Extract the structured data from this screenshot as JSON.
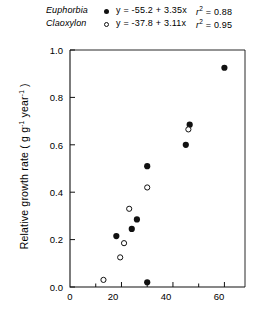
{
  "legend": {
    "entries": [
      {
        "species": "Euphorbia",
        "marker": "filled-circle",
        "equation": "y = -55.2  + 3.35x",
        "r2_label": "r",
        "r2_exp": "2",
        "r2_value": "= 0.88"
      },
      {
        "species": "Claoxylon",
        "marker": "open-circle",
        "equation": "y = -37.8  + 3.11x",
        "r2_label": "r",
        "r2_exp": "2",
        "r2_value": "= 0.95"
      }
    ]
  },
  "axes": {
    "ylabel_pre": "Relative growth rate ( g g",
    "ylabel_sup1": "-1",
    "ylabel_mid": " year",
    "ylabel_sup2": "-1",
    "ylabel_post": " )",
    "yticks": [
      "0.0",
      "0.2",
      "0.4",
      "0.6",
      "0.8",
      "1.0"
    ],
    "xticks": [
      "0",
      "20",
      "40",
      "60"
    ]
  },
  "colors": {
    "axis": "#111111",
    "marker": "#111111",
    "background": "#ffffff"
  },
  "chart_data": {
    "type": "scatter",
    "title": "",
    "xlabel": "",
    "ylabel": "Relative growth rate (g g-1 year-1)",
    "xlim": [
      0,
      68
    ],
    "ylim": [
      0.0,
      1.0
    ],
    "xticks": [
      0,
      20,
      40,
      60
    ],
    "xminorticks": [
      10,
      30,
      50
    ],
    "yticks": [
      0.0,
      0.2,
      0.4,
      0.6,
      0.8,
      1.0
    ],
    "grid": false,
    "legend_position": "above-plot",
    "series": [
      {
        "name": "Euphorbia",
        "marker": "filled-circle",
        "fit": {
          "intercept": -55.2,
          "slope": 3.35,
          "r2": 0.88
        },
        "points": [
          {
            "x": 18,
            "y": 0.215
          },
          {
            "x": 24,
            "y": 0.245
          },
          {
            "x": 26,
            "y": 0.285
          },
          {
            "x": 30,
            "y": 0.02
          },
          {
            "x": 30,
            "y": 0.51
          },
          {
            "x": 45,
            "y": 0.6
          },
          {
            "x": 46.5,
            "y": 0.685
          },
          {
            "x": 60,
            "y": 0.925
          }
        ]
      },
      {
        "name": "Claoxylon",
        "marker": "open-circle",
        "fit": {
          "intercept": -37.8,
          "slope": 3.11,
          "r2": 0.95
        },
        "points": [
          {
            "x": 13,
            "y": 0.03
          },
          {
            "x": 19.5,
            "y": 0.125
          },
          {
            "x": 21,
            "y": 0.185
          },
          {
            "x": 23,
            "y": 0.33
          },
          {
            "x": 30,
            "y": 0.42
          },
          {
            "x": 46,
            "y": 0.665
          }
        ]
      }
    ]
  }
}
